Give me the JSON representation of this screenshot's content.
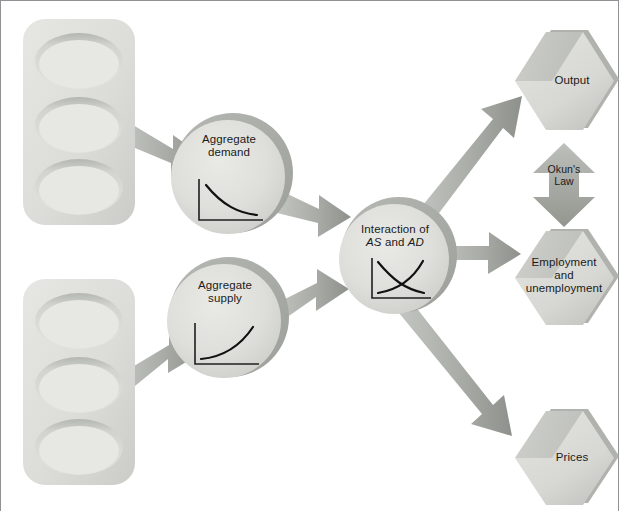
{
  "diagram": {
    "type": "flowchart",
    "background_color": "#ffffff",
    "shape_fill_color": "#d9dad6",
    "shape_shadow_color": "#a8aaa6",
    "arrow_color": "#9a9c99",
    "text_color": "#1a1a1a",
    "border_color": "#8f9194"
  },
  "inputs": [
    {
      "id": "input-stack-top",
      "label": "",
      "wells": [
        "",
        "",
        ""
      ]
    },
    {
      "id": "input-stack-bottom",
      "label": "",
      "wells": [
        "",
        "",
        ""
      ]
    }
  ],
  "circles": [
    {
      "id": "aggregate-demand",
      "line1": "Aggregate",
      "line2": "demand",
      "chart": {
        "type": "line",
        "shape": "downward-sloping-convex",
        "name": "aggregate-demand-curve"
      }
    },
    {
      "id": "aggregate-supply",
      "line1": "Aggregate",
      "line2": "supply",
      "chart": {
        "type": "line",
        "shape": "upward-sloping-convex",
        "name": "aggregate-supply-curve"
      }
    },
    {
      "id": "interaction",
      "line1": "Interaction of",
      "line2_pre": "AS",
      "line2_mid": " and ",
      "line2_post": "AD",
      "chart": {
        "type": "line",
        "shape": "crossing-supply-demand",
        "name": "as-ad-intersection-chart"
      }
    }
  ],
  "outcomes": [
    {
      "id": "output",
      "label": "Output"
    },
    {
      "id": "employment",
      "label": "Employment\nand\nunemployment"
    },
    {
      "id": "prices",
      "label": "Prices"
    }
  ],
  "connector": {
    "id": "okuns-law",
    "line1": "Okun's",
    "line2": "Law",
    "direction": "bidirectional"
  },
  "arrows": [
    {
      "name": "arrow-input-top-to-aggregate-demand",
      "from": "input-stack-top",
      "to": "aggregate-demand"
    },
    {
      "name": "arrow-input-bottom-to-aggregate-supply",
      "from": "input-stack-bottom",
      "to": "aggregate-supply"
    },
    {
      "name": "arrow-aggregate-demand-to-interaction",
      "from": "aggregate-demand",
      "to": "interaction"
    },
    {
      "name": "arrow-aggregate-supply-to-interaction",
      "from": "aggregate-supply",
      "to": "interaction"
    },
    {
      "name": "arrow-interaction-to-output",
      "from": "interaction",
      "to": "output"
    },
    {
      "name": "arrow-interaction-to-employment",
      "from": "interaction",
      "to": "employment"
    },
    {
      "name": "arrow-interaction-to-prices",
      "from": "interaction",
      "to": "prices"
    },
    {
      "name": "arrow-okuns-law-bidirectional",
      "from": "output",
      "to": "employment"
    }
  ]
}
